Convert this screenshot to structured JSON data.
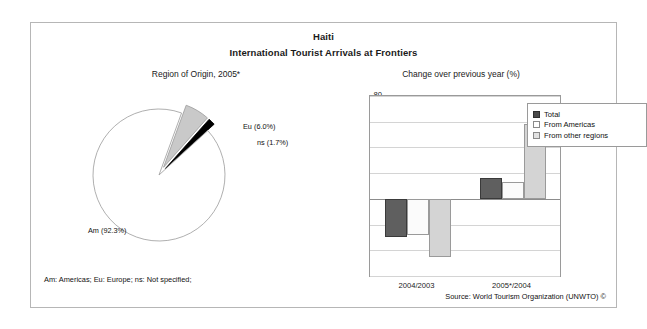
{
  "title": {
    "main": "Haiti",
    "sub": "International Tourist Arrivals at Frontiers"
  },
  "panels": {
    "pie_heading": "Region of Origin, 2005*",
    "bar_heading": "Change over previous year (%)"
  },
  "footer": {
    "abbreviations": "Am: Americas; Eu: Europe; ns: Not specified;",
    "source": "Source: World Tourism Organization (UNWTO) ©"
  },
  "chart_data": [
    {
      "type": "pie",
      "title": "Region of Origin, 2005*",
      "labels": [
        "Am (92.3%)",
        "Eu (6.0%)",
        "ns (1.7%)"
      ],
      "categories": [
        "Am",
        "Eu",
        "ns"
      ],
      "values": [
        92.3,
        6.0,
        1.7
      ],
      "units": "percent",
      "colors": [
        "#ffffff",
        "#c9c9c9",
        "#000000"
      ],
      "exploded": [
        "Eu",
        "ns"
      ],
      "legend": "none"
    },
    {
      "type": "bar",
      "title": "Change over previous year (%)",
      "xlabel": "",
      "ylabel": "",
      "categories": [
        "2004/2003",
        "2005*/2004"
      ],
      "series": [
        {
          "name": "Total",
          "values": [
            -30,
            16
          ],
          "color": "#5f5f5f"
        },
        {
          "name": "From Americas",
          "values": [
            -28,
            13.5
          ],
          "color": "#fbfbfb"
        },
        {
          "name": "From other regions",
          "values": [
            -45,
            58
          ],
          "color": "#d4d4d4"
        }
      ],
      "yticks": [
        80,
        60,
        40,
        20,
        0,
        -20,
        -40,
        -60
      ],
      "ylim": [
        -60,
        80
      ],
      "grid": true,
      "legend_position": "top-right"
    }
  ]
}
